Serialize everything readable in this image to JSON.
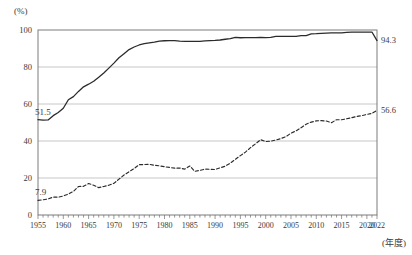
{
  "axis": {
    "y_unit": "(%)",
    "x_unit": "(年度)",
    "y_ticks": [
      "0",
      "20",
      "40",
      "60",
      "80",
      "100"
    ],
    "x_ticks": [
      "1955",
      "1960",
      "1965",
      "1970",
      "1975",
      "1980",
      "1985",
      "1990",
      "1995",
      "2000",
      "2005",
      "2010",
      "2015",
      "2020",
      "2022"
    ]
  },
  "annotations": {
    "solid_start": "51.5",
    "solid_end": "94.3",
    "dashed_start": "7.9",
    "dashed_end": "56.6"
  },
  "footnotes": {
    "left": "",
    "right": ""
  },
  "colors": {
    "solid_line": "#2b2b2b",
    "dashed_line": "#2b2b2b",
    "gridline": "#b9b9b9",
    "axis": "#6e6e6e",
    "text": "#3a3a3a",
    "background": "#ffffff"
  },
  "chart_data": {
    "type": "line",
    "title": "",
    "subtitle": "",
    "xlabel": "(年度)",
    "ylabel": "(%)",
    "xlim": [
      1955,
      2022
    ],
    "ylim": [
      0,
      100
    ],
    "grid": true,
    "legend_position": "none",
    "x": [
      1955,
      1956,
      1957,
      1958,
      1959,
      1960,
      1961,
      1962,
      1963,
      1964,
      1965,
      1966,
      1967,
      1968,
      1969,
      1970,
      1971,
      1972,
      1973,
      1974,
      1975,
      1976,
      1977,
      1978,
      1979,
      1980,
      1981,
      1982,
      1983,
      1984,
      1985,
      1986,
      1987,
      1988,
      1989,
      1990,
      1991,
      1992,
      1993,
      1994,
      1995,
      1996,
      1997,
      1998,
      1999,
      2000,
      2001,
      2002,
      2003,
      2004,
      2005,
      2006,
      2007,
      2008,
      2009,
      2010,
      2011,
      2012,
      2013,
      2014,
      2015,
      2016,
      2017,
      2018,
      2019,
      2020,
      2021,
      2022
    ],
    "series": [
      {
        "name": "高等学校等進学率",
        "style": "solid",
        "start_value": 51.5,
        "end_value": 94.3,
        "values": [
          51.5,
          51.3,
          51.4,
          53.7,
          55.4,
          57.7,
          62.3,
          64.0,
          66.8,
          69.3,
          70.7,
          72.3,
          74.5,
          76.8,
          79.4,
          82.1,
          85.0,
          87.2,
          89.4,
          90.8,
          91.9,
          92.6,
          93.1,
          93.5,
          94.0,
          94.2,
          94.3,
          94.3,
          94.0,
          93.9,
          93.8,
          93.8,
          93.9,
          94.1,
          94.3,
          94.4,
          94.6,
          95.0,
          95.3,
          96.0,
          95.8,
          95.9,
          95.9,
          95.9,
          96.0,
          95.9,
          96.0,
          96.5,
          96.6,
          96.5,
          96.5,
          96.5,
          97.0,
          97.0,
          97.9,
          98.0,
          98.2,
          98.3,
          98.4,
          98.4,
          98.5,
          98.7,
          98.8,
          98.8,
          98.8,
          98.8,
          98.9,
          94.3
        ]
      },
      {
        "name": "大学・短期大学等進学率",
        "style": "dashed",
        "start_value": 7.9,
        "end_value": 56.6,
        "values": [
          7.9,
          8.2,
          8.7,
          9.7,
          9.6,
          10.3,
          11.3,
          12.8,
          15.4,
          15.5,
          17.0,
          16.1,
          14.8,
          15.4,
          16.1,
          17.1,
          19.4,
          21.6,
          23.4,
          25.1,
          27.2,
          27.3,
          27.4,
          26.9,
          26.6,
          26.1,
          25.7,
          25.3,
          25.4,
          24.8,
          26.5,
          23.6,
          24.1,
          24.8,
          24.7,
          24.6,
          25.5,
          26.4,
          28.0,
          30.1,
          32.1,
          34.0,
          36.4,
          38.5,
          40.7,
          39.7,
          39.9,
          40.5,
          41.3,
          42.4,
          44.2,
          45.5,
          47.2,
          49.1,
          50.2,
          50.9,
          51.0,
          50.8,
          49.9,
          51.5,
          51.5,
          52.0,
          52.6,
          53.3,
          53.7,
          54.4,
          54.9,
          56.6
        ]
      }
    ]
  }
}
